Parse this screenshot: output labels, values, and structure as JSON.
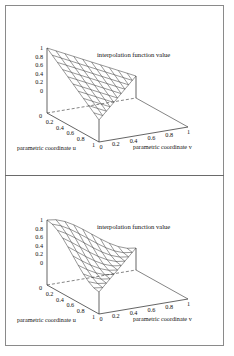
{
  "figure": {
    "panels": [
      {
        "id": "linear",
        "title": "interpolation function value",
        "z_ticks": [
          "0",
          "0.2",
          "0.4",
          "0.6",
          "0.8",
          "1"
        ],
        "u_ticks": [
          "0",
          "0.2",
          "0.4",
          "0.6",
          "0.8",
          "1"
        ],
        "v_ticks": [
          "0",
          "0.2",
          "0.4",
          "0.6",
          "0.8",
          "1"
        ],
        "u_label": "parametric coordinate u",
        "v_label": "parametric coordinate v"
      },
      {
        "id": "smooth",
        "title": "interpolation function value",
        "z_ticks": [
          "0",
          "0.2",
          "0.4",
          "0.6",
          "0.8",
          "1"
        ],
        "u_ticks": [
          "0",
          "0.2",
          "0.4",
          "0.6",
          "0.8",
          "1"
        ],
        "v_ticks": [
          "0",
          "0.2",
          "0.4",
          "0.6",
          "0.8",
          "1"
        ],
        "u_label": "parametric coordinate u",
        "v_label": "parametric coordinate v"
      }
    ]
  },
  "chart_data": [
    {
      "type": "surface",
      "title": "interpolation function value",
      "xlabel": "parametric coordinate u",
      "ylabel": "parametric coordinate v",
      "zlabel": "",
      "domain": "triangle u>=0, v>=0, u+v<=1",
      "function": "N = 1 - u - v (linear)",
      "x_ticks": [
        0,
        0.2,
        0.4,
        0.6,
        0.8,
        1
      ],
      "y_ticks": [
        0,
        0.2,
        0.4,
        0.6,
        0.8,
        1
      ],
      "z_ticks": [
        0,
        0.2,
        0.4,
        0.6,
        0.8,
        1
      ],
      "zlim": [
        0,
        1
      ],
      "corner_values": {
        "u0_v0": 1,
        "u1_v0": 0,
        "u0_v1": 0
      },
      "grid_divisions": 10
    },
    {
      "type": "surface",
      "title": "interpolation function value",
      "xlabel": "parametric coordinate u",
      "ylabel": "parametric coordinate v",
      "zlabel": "",
      "domain": "triangle u>=0, v>=0, u+v<=1",
      "function": "smooth (cubic) function of L = 1 - u - v, value 1 at u=v=0, 0 on edge u+v=1",
      "x_ticks": [
        0,
        0.2,
        0.4,
        0.6,
        0.8,
        1
      ],
      "y_ticks": [
        0,
        0.2,
        0.4,
        0.6,
        0.8,
        1
      ],
      "z_ticks": [
        0,
        0.2,
        0.4,
        0.6,
        0.8,
        1
      ],
      "zlim": [
        0,
        1
      ],
      "corner_values": {
        "u0_v0": 1,
        "u1_v0": 0,
        "u0_v1": 0
      },
      "grid_divisions": 10
    }
  ]
}
